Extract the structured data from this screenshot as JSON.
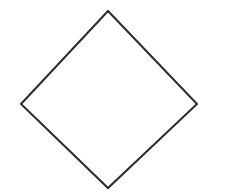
{
  "figure": {
    "shape_name": "diamond",
    "background_color": "#ffffff",
    "stroke_color": "#2b2b2b",
    "stroke_width_px": 2,
    "fill": "none",
    "canvas": {
      "width": 231,
      "height": 195
    },
    "vertices": [
      {
        "name": "top",
        "x": 108,
        "y": 11
      },
      {
        "name": "right",
        "x": 197,
        "y": 104
      },
      {
        "name": "bottom",
        "x": 108,
        "y": 188
      },
      {
        "name": "left",
        "x": 21,
        "y": 104
      }
    ],
    "polygon_points": "108,11 197,104 108,188 21,104",
    "edges": [
      {
        "name": "top-left-edge",
        "from": "left",
        "to": "top"
      },
      {
        "name": "top-right-edge",
        "from": "top",
        "to": "right"
      },
      {
        "name": "bottom-right-edge",
        "from": "right",
        "to": "bottom"
      },
      {
        "name": "bottom-left-edge",
        "from": "bottom",
        "to": "left"
      }
    ],
    "artifacts": [
      {
        "name": "top-left-smudge",
        "x": 18,
        "y": 8,
        "width": 5,
        "height": 14,
        "color": "#fbfbfb"
      },
      {
        "name": "center-smudge",
        "x": 109,
        "y": 96,
        "width": 4,
        "height": 9,
        "color": "#fbfbfb"
      },
      {
        "name": "bottom-right-smudge",
        "x": 210,
        "y": 179,
        "width": 5,
        "height": 13,
        "color": "#fbfbfb"
      }
    ]
  }
}
